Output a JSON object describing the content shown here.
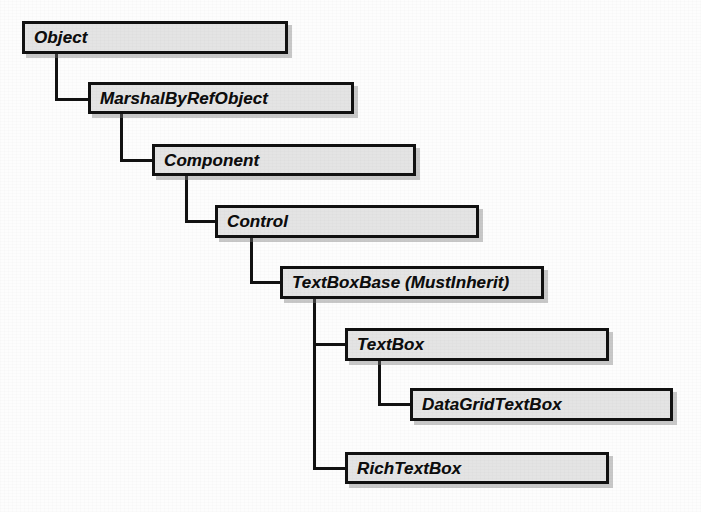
{
  "figure": {
    "type": "class-inheritance-hierarchy",
    "background_color": "#fdfdfd",
    "box_fill_color": "#e4e4e4",
    "box_border_color": "#111111",
    "connector_color": "#121212",
    "text_color": "#0d0d0d"
  },
  "nodes": [
    {
      "id": "object",
      "label": "Object",
      "x": 22,
      "y": 21,
      "w": 266,
      "h": 33
    },
    {
      "id": "marshalbyrefobject",
      "label": "MarshalByRefObject",
      "x": 88,
      "y": 82,
      "w": 266,
      "h": 32
    },
    {
      "id": "component",
      "label": "Component",
      "x": 152,
      "y": 144,
      "w": 264,
      "h": 32
    },
    {
      "id": "control",
      "label": "Control",
      "x": 215,
      "y": 205,
      "w": 264,
      "h": 33
    },
    {
      "id": "textboxbase",
      "label": "TextBoxBase (MustInherit)",
      "x": 280,
      "y": 266,
      "w": 264,
      "h": 33
    },
    {
      "id": "textbox",
      "label": "TextBox",
      "x": 345,
      "y": 328,
      "w": 264,
      "h": 33
    },
    {
      "id": "datagridtextbox",
      "label": "DataGridTextBox",
      "x": 410,
      "y": 388,
      "w": 263,
      "h": 33
    },
    {
      "id": "richtextbox",
      "label": "RichTextBox",
      "x": 345,
      "y": 452,
      "w": 264,
      "h": 32
    }
  ],
  "edges": [
    {
      "id": "object-to-marshalbyrefobject",
      "from": "object",
      "to": "marshalbyrefobject"
    },
    {
      "id": "marshalbyrefobject-to-component",
      "from": "marshalbyrefobject",
      "to": "component"
    },
    {
      "id": "component-to-control",
      "from": "component",
      "to": "control"
    },
    {
      "id": "control-to-textboxbase",
      "from": "control",
      "to": "textboxbase"
    },
    {
      "id": "textboxbase-to-textbox",
      "from": "textboxbase",
      "to": "textbox"
    },
    {
      "id": "textbox-to-datagridtextbox",
      "from": "textbox",
      "to": "datagridtextbox"
    },
    {
      "id": "textboxbase-to-richtextbox",
      "from": "textboxbase",
      "to": "richtextbox"
    }
  ],
  "connector_segments": [
    {
      "id": "seg-object-v",
      "orient": "v",
      "x": 55,
      "y": 53,
      "len": 46
    },
    {
      "id": "seg-object-h",
      "orient": "h",
      "x": 55,
      "y": 98,
      "len": 36
    },
    {
      "id": "seg-marshal-v",
      "orient": "v",
      "x": 120,
      "y": 113,
      "len": 48
    },
    {
      "id": "seg-marshal-h",
      "orient": "h",
      "x": 120,
      "y": 159,
      "len": 35
    },
    {
      "id": "seg-component-v",
      "orient": "v",
      "x": 185,
      "y": 176,
      "len": 46
    },
    {
      "id": "seg-component-h",
      "orient": "h",
      "x": 185,
      "y": 220,
      "len": 33
    },
    {
      "id": "seg-control-v",
      "orient": "v",
      "x": 250,
      "y": 237,
      "len": 46
    },
    {
      "id": "seg-control-h",
      "orient": "h",
      "x": 250,
      "y": 281,
      "len": 33
    },
    {
      "id": "seg-textboxbase-trunk-v",
      "orient": "v",
      "x": 313,
      "y": 298,
      "len": 172
    },
    {
      "id": "seg-textbox-h",
      "orient": "h",
      "x": 313,
      "y": 343,
      "len": 35
    },
    {
      "id": "seg-richtextbox-h",
      "orient": "h",
      "x": 313,
      "y": 467,
      "len": 35
    },
    {
      "id": "seg-datagrid-v",
      "orient": "v",
      "x": 378,
      "y": 360,
      "len": 45
    },
    {
      "id": "seg-datagrid-h",
      "orient": "h",
      "x": 378,
      "y": 403,
      "len": 35
    }
  ]
}
